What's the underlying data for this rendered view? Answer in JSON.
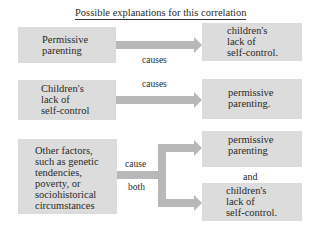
{
  "title": "Possible explanations for this correlation",
  "colors": {
    "box": "#dcdcdc",
    "arrow": "#b8b8b8",
    "text": "#2a2a2a"
  },
  "row1": {
    "cause": [
      "Permissive",
      "parenting"
    ],
    "verb": "causes",
    "effect": [
      "children's",
      "lack of",
      "self-control."
    ]
  },
  "row2": {
    "cause": [
      "Children's",
      "lack of",
      "self-control"
    ],
    "verb": "causes",
    "effect": [
      "permissive",
      "parenting."
    ]
  },
  "row3": {
    "cause": [
      "Other factors,",
      "such as genetic",
      "tendencies,",
      "poverty, or",
      "sociohistorical",
      "circumstances"
    ],
    "verb_top": "cause",
    "verb_bottom": "both",
    "effect_top": [
      "permissive",
      "parenting"
    ],
    "conjunction": "and",
    "effect_bottom": [
      "children's",
      "lack of",
      "self-control."
    ]
  }
}
